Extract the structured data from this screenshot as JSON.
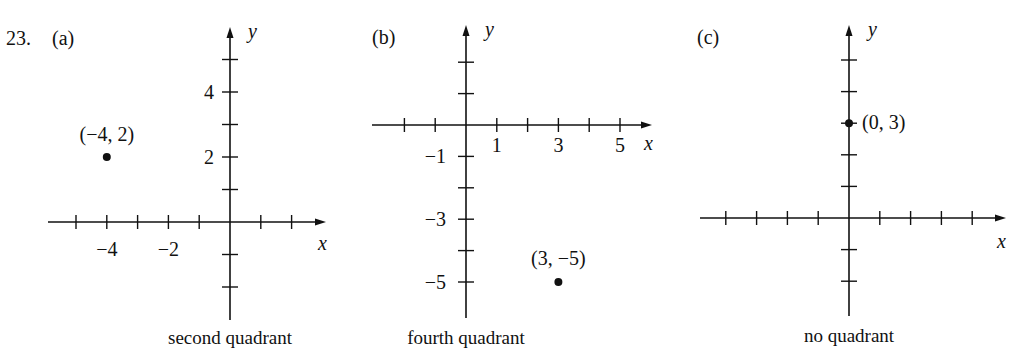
{
  "problem_number": "23.",
  "chart_data": [
    {
      "type": "scatter",
      "panel_label": "(a)",
      "caption": "second quadrant",
      "xlabel": "x",
      "ylabel": "y",
      "grid": false,
      "xlim": [
        -5,
        2
      ],
      "ylim": [
        -3,
        5
      ],
      "x_tick_labels": [
        {
          "value": -4,
          "label": "−4"
        },
        {
          "value": -2,
          "label": "−2"
        }
      ],
      "y_tick_labels": [
        {
          "value": 4,
          "label": "4"
        },
        {
          "value": 2,
          "label": "2"
        }
      ],
      "points": [
        {
          "x": -4,
          "y": 2,
          "label": "(−4, 2)"
        }
      ],
      "layout": {
        "origin": [
          230,
          222
        ],
        "unit_x": 30.8,
        "unit_y": 32.5,
        "x_start": 48,
        "x_end": 326,
        "y_top": 27,
        "y_bottom": 320,
        "x_ticks": [
          -5,
          -4,
          -3,
          -2,
          -1,
          1,
          2
        ],
        "y_ticks": [
          5,
          4,
          3,
          2,
          1,
          -1,
          -2
        ],
        "panel_label_pos": [
          52,
          45
        ],
        "caption_pos": [
          230,
          344
        ],
        "xlabel_pos": [
          318,
          250
        ],
        "ylabel_pos": [
          248,
          38
        ],
        "x_tick_label_dy": 34,
        "y_tick_label_dx": -16,
        "point_label_offset": [
          0,
          -16
        ],
        "point_label_anchor": "middle"
      }
    },
    {
      "type": "scatter",
      "panel_label": "(b)",
      "caption": "fourth quadrant",
      "xlabel": "x",
      "ylabel": "y",
      "grid": false,
      "xlim": [
        -2,
        5
      ],
      "ylim": [
        -6,
        2
      ],
      "x_tick_labels": [
        {
          "value": 1,
          "label": "1"
        },
        {
          "value": 3,
          "label": "3"
        },
        {
          "value": 5,
          "label": "5"
        }
      ],
      "y_tick_labels": [
        {
          "value": -1,
          "label": "−1"
        },
        {
          "value": -3,
          "label": "−3"
        },
        {
          "value": -5,
          "label": "−5"
        }
      ],
      "points": [
        {
          "x": 3,
          "y": -5,
          "label": "(3, −5)"
        }
      ],
      "layout": {
        "origin": [
          466,
          125
        ],
        "unit_x": 30.8,
        "unit_y": 31.4,
        "x_start": 372,
        "x_end": 652,
        "y_top": 25,
        "y_bottom": 318,
        "x_ticks": [
          -2,
          -1,
          1,
          2,
          3,
          4,
          5
        ],
        "y_ticks": [
          2,
          1,
          -1,
          -2,
          -3,
          -4,
          -5
        ],
        "panel_label_pos": [
          372,
          44
        ],
        "caption_pos": [
          466,
          344
        ],
        "xlabel_pos": [
          644,
          150
        ],
        "ylabel_pos": [
          485,
          36
        ],
        "x_tick_label_dy": 27,
        "y_tick_label_dx": -20,
        "point_label_offset": [
          0,
          -17
        ],
        "point_label_anchor": "middle"
      }
    },
    {
      "type": "scatter",
      "panel_label": "(c)",
      "caption": "no quadrant",
      "xlabel": "x",
      "ylabel": "y",
      "grid": false,
      "xlim": [
        -4,
        5
      ],
      "ylim": [
        -3,
        5
      ],
      "x_tick_labels": [],
      "y_tick_labels": [],
      "points": [
        {
          "x": 0,
          "y": 3,
          "label": "(0, 3)"
        }
      ],
      "layout": {
        "origin": [
          849,
          218
        ],
        "unit_x": 30.8,
        "unit_y": 31.6,
        "x_start": 700,
        "x_end": 1006,
        "y_top": 25,
        "y_bottom": 316,
        "x_ticks": [
          -4,
          -3,
          -2,
          -1,
          1,
          2,
          3,
          4
        ],
        "y_ticks": [
          5,
          4,
          3,
          2,
          1,
          -1,
          -2
        ],
        "panel_label_pos": [
          697,
          44
        ],
        "caption_pos": [
          849,
          342
        ],
        "xlabel_pos": [
          997,
          248
        ],
        "ylabel_pos": [
          868,
          36
        ],
        "x_tick_label_dy": 27,
        "y_tick_label_dx": -16,
        "point_label_offset": [
          13,
          6
        ],
        "point_label_anchor": "start"
      }
    }
  ]
}
